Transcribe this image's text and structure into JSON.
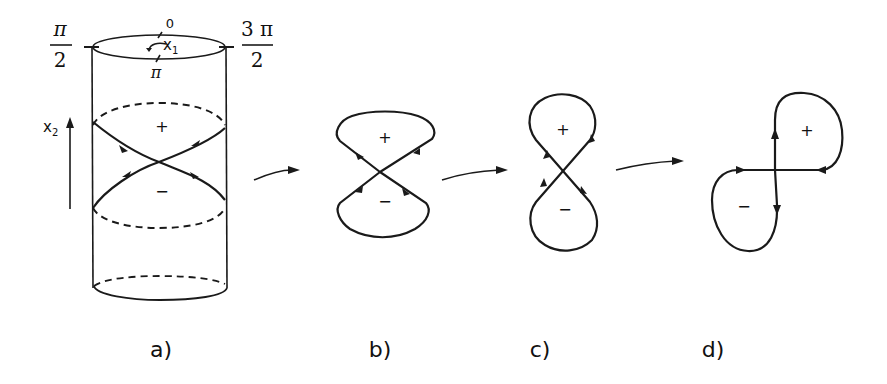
{
  "figure": {
    "stroke_color": "#1a1a1a",
    "background": "#ffffff",
    "panel_a": {
      "caption": "a)",
      "angle_left_num": "π",
      "angle_left_den": "2",
      "angle_right_num": "3 π",
      "angle_right_den": "2",
      "angle_top": "0",
      "angle_bottom": "π",
      "axis_x1": "x",
      "axis_x1_sub": "1",
      "axis_x2": "x",
      "axis_x2_sub": "2",
      "sign_upper": "+",
      "sign_lower": "−"
    },
    "panel_b": {
      "caption": "b)",
      "sign_upper": "+",
      "sign_lower": "−"
    },
    "panel_c": {
      "caption": "c)",
      "sign_upper": "+",
      "sign_lower": "−"
    },
    "panel_d": {
      "caption": "d)",
      "sign_upper": "+",
      "sign_lower": "−"
    }
  }
}
